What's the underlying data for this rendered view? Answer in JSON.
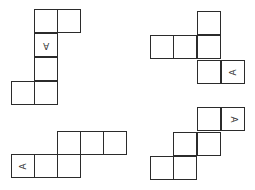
{
  "diagram": {
    "title": "",
    "line_color": "#2b2b2b",
    "cell_size": 24,
    "nets": [
      {
        "id": "net-1",
        "position": "top-left",
        "cells": [
          {
            "x": 34,
            "y": 9,
            "label": ""
          },
          {
            "x": 57,
            "y": 9,
            "label": ""
          },
          {
            "x": 34,
            "y": 33,
            "label": "A",
            "rotation": 180
          },
          {
            "x": 34,
            "y": 57,
            "label": ""
          },
          {
            "x": 34,
            "y": 81,
            "label": ""
          },
          {
            "x": 11,
            "y": 81,
            "label": ""
          }
        ]
      },
      {
        "id": "net-2",
        "position": "top-right",
        "cells": [
          {
            "x": 197,
            "y": 11,
            "label": ""
          },
          {
            "x": 150,
            "y": 35,
            "label": ""
          },
          {
            "x": 173,
            "y": 35,
            "label": ""
          },
          {
            "x": 197,
            "y": 35,
            "label": ""
          },
          {
            "x": 197,
            "y": 60,
            "label": ""
          },
          {
            "x": 221,
            "y": 60,
            "label": "A",
            "rotation": -90
          }
        ]
      },
      {
        "id": "net-3",
        "position": "bottom-left",
        "cells": [
          {
            "x": 57,
            "y": 131,
            "label": ""
          },
          {
            "x": 80,
            "y": 131,
            "label": ""
          },
          {
            "x": 103,
            "y": 131,
            "label": ""
          },
          {
            "x": 11,
            "y": 154,
            "label": "A",
            "rotation": -90
          },
          {
            "x": 34,
            "y": 154,
            "label": ""
          },
          {
            "x": 57,
            "y": 154,
            "label": ""
          }
        ]
      },
      {
        "id": "net-4",
        "position": "bottom-right",
        "cells": [
          {
            "x": 197,
            "y": 107,
            "label": ""
          },
          {
            "x": 221,
            "y": 107,
            "label": "A",
            "rotation": 90
          },
          {
            "x": 173,
            "y": 132,
            "label": ""
          },
          {
            "x": 197,
            "y": 132,
            "label": ""
          },
          {
            "x": 150,
            "y": 156,
            "label": ""
          },
          {
            "x": 173,
            "y": 156,
            "label": ""
          }
        ]
      }
    ]
  }
}
